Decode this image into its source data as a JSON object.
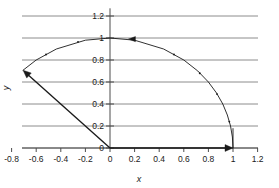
{
  "chart_data": {
    "type": "line",
    "title": "",
    "xlabel": "x",
    "ylabel": "y",
    "xlim": [
      -0.9,
      1.25
    ],
    "ylim": [
      -0.05,
      1.27
    ],
    "grid": true,
    "grid_orientation": "horizontal",
    "legend": null,
    "xticks": [
      "-0.8",
      "-0.6",
      "-0.4",
      "-0.2",
      "0",
      "0.2",
      "0.4",
      "0.6",
      "0.8",
      "1",
      "1.2"
    ],
    "xtick_values": [
      -0.8,
      -0.6,
      -0.4,
      -0.2,
      0,
      0.2,
      0.4,
      0.6,
      0.8,
      1.0,
      1.2
    ],
    "yticks": [
      "0",
      "0.2",
      "0.4",
      "0.6",
      "0.8",
      "1",
      "1.2"
    ],
    "ytick_values": [
      0,
      0.2,
      0.4,
      0.6,
      0.8,
      1.0,
      1.2
    ],
    "series": [
      {
        "name": "unit-circle-arc",
        "description": "Arc of radius 1 traced counter-clockwise from (1,0) through (0,1) to (-0.7,0.7)",
        "style": "solid-thin-with-direction-arrows",
        "points": [
          {
            "x": 1.0,
            "y": 0.0
          },
          {
            "x": 0.995,
            "y": 0.1
          },
          {
            "x": 0.98,
            "y": 0.2
          },
          {
            "x": 0.954,
            "y": 0.3
          },
          {
            "x": 0.917,
            "y": 0.4
          },
          {
            "x": 0.866,
            "y": 0.5
          },
          {
            "x": 0.8,
            "y": 0.6
          },
          {
            "x": 0.714,
            "y": 0.7
          },
          {
            "x": 0.6,
            "y": 0.8
          },
          {
            "x": 0.436,
            "y": 0.9
          },
          {
            "x": 0.2,
            "y": 0.98
          },
          {
            "x": 0.0,
            "y": 1.0
          },
          {
            "x": -0.2,
            "y": 0.98
          },
          {
            "x": -0.436,
            "y": 0.9
          },
          {
            "x": -0.6,
            "y": 0.8
          },
          {
            "x": -0.707,
            "y": 0.707
          }
        ],
        "arrow_markers": [
          {
            "x": 0.15,
            "y": 0.99,
            "dir": "left"
          },
          {
            "x": -0.707,
            "y": 0.707,
            "dir": "terminal-left"
          }
        ],
        "tick_dots": [
          {
            "x": 0.97,
            "y": 0.24
          },
          {
            "x": 0.87,
            "y": 0.49
          },
          {
            "x": 0.73,
            "y": 0.68
          },
          {
            "x": 0.52,
            "y": 0.85
          },
          {
            "x": -0.26,
            "y": 0.965
          },
          {
            "x": -0.52,
            "y": 0.85
          }
        ]
      },
      {
        "name": "radius-vector",
        "description": "Straight arrow from origin (0,0) to (-0.7,0.7)",
        "style": "solid-thick-with-arrowhead",
        "points": [
          {
            "x": 0.0,
            "y": 0.0
          },
          {
            "x": -0.707,
            "y": 0.707
          }
        ]
      },
      {
        "name": "x-axis-vector",
        "description": "Straight arrow from origin (0,0) to (1,0) along the x-axis",
        "style": "solid-thick-with-arrowhead",
        "points": [
          {
            "x": 0.0,
            "y": 0.0
          },
          {
            "x": 1.0,
            "y": 0.0
          }
        ]
      },
      {
        "name": "vertical-drop",
        "description": "Short vertical segment at x=1 from the arc down to (1,0)",
        "style": "solid-thin",
        "points": [
          {
            "x": 1.0,
            "y": 0.18
          },
          {
            "x": 1.0,
            "y": 0.0
          }
        ]
      }
    ],
    "colors": {
      "grid": "#808080",
      "axis": "#4d4d4d",
      "curve": "#1a1a1a",
      "vector": "#1a1a1a",
      "background": "#ffffff",
      "text": "#1a1a1a"
    }
  }
}
